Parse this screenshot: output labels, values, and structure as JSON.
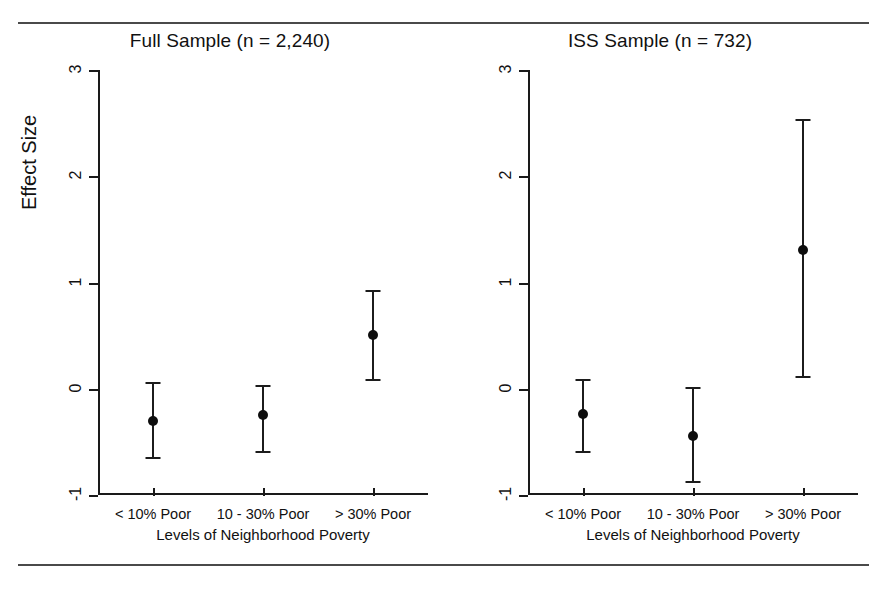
{
  "figure": {
    "rules": [
      "top-rule",
      "bottom-rule"
    ]
  },
  "chart_data": {
    "type": "scatter",
    "title": "",
    "xlabel": "Levels of Neighborhood Poverty",
    "ylabel": "Effect Size",
    "ylim": [
      -1,
      3
    ],
    "yticks": [
      "-1",
      "0",
      "1",
      "2",
      "3"
    ],
    "grid": false,
    "legend": "none",
    "categories": [
      "< 10% Poor",
      "10 - 30% Poor",
      "> 30% Poor"
    ],
    "panels": [
      {
        "title": "Full Sample (n = 2,240)",
        "xlabel": "Levels of Neighborhood Poverty",
        "ylabel": "Effect Size",
        "points": [
          {
            "category": "< 10% Poor",
            "value": -0.3,
            "ci_low": -0.64,
            "ci_high": 0.06
          },
          {
            "category": "10 - 30% Poor",
            "value": -0.25,
            "ci_low": -0.59,
            "ci_high": 0.04
          },
          {
            "category": "> 30% Poor",
            "value": 0.51,
            "ci_low": 0.09,
            "ci_high": 0.93
          }
        ]
      },
      {
        "title": "ISS Sample (n = 732)",
        "xlabel": "Levels of Neighborhood Poverty",
        "ylabel": "Effect Size",
        "points": [
          {
            "category": "< 10% Poor",
            "value": -0.24,
            "ci_low": -0.59,
            "ci_high": 0.09
          },
          {
            "category": "10 - 30% Poor",
            "value": -0.44,
            "ci_low": -0.87,
            "ci_high": 0.02
          },
          {
            "category": "> 30% Poor",
            "value": 1.31,
            "ci_low": 0.12,
            "ci_high": 2.54
          }
        ]
      }
    ]
  }
}
